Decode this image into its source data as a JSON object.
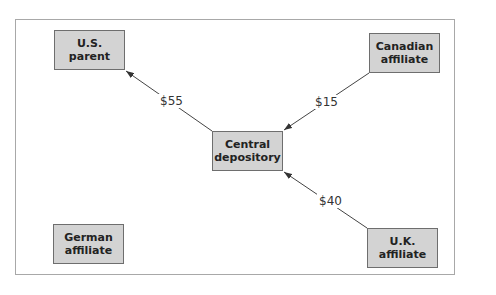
{
  "diagram": {
    "nodes": [
      {
        "id": "us_parent",
        "line1": "U.S.",
        "line2": "parent"
      },
      {
        "id": "canadian_affiliate",
        "line1": "Canadian",
        "line2": "affiliate"
      },
      {
        "id": "central_depository",
        "line1": "Central",
        "line2": "depository"
      },
      {
        "id": "german_affiliate",
        "line1": "German",
        "line2": "affiliate"
      },
      {
        "id": "uk_affiliate",
        "line1": "U.K.",
        "line2": "affiliate"
      }
    ],
    "edges": [
      {
        "from": "central_depository",
        "to": "us_parent",
        "label": "$55"
      },
      {
        "from": "canadian_affiliate",
        "to": "central_depository",
        "label": "$15"
      },
      {
        "from": "uk_affiliate",
        "to": "central_depository",
        "label": "$40"
      }
    ],
    "colors": {
      "node_fill": "#d3d3d3",
      "node_border": "#6e6e6e",
      "line": "#444444",
      "frame": "#a8a8a8"
    }
  }
}
